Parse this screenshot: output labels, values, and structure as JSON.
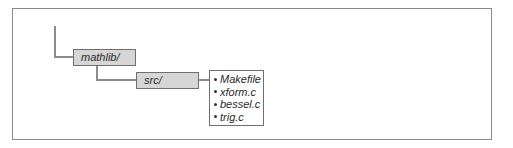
{
  "diagram": {
    "type": "directory-tree",
    "nodes": [
      {
        "id": "mathlib",
        "label": "mathlib/",
        "kind": "directory",
        "parent": null
      },
      {
        "id": "src",
        "label": "src/",
        "kind": "directory",
        "parent": "mathlib"
      }
    ],
    "files": {
      "parent": "src",
      "items": [
        {
          "label": "Makefile"
        },
        {
          "label": "xform.c"
        },
        {
          "label": "bessel.c"
        },
        {
          "label": "trig.c"
        }
      ]
    },
    "colors": {
      "node_fill": "#d6d6d6",
      "node_border": "#6f6f6f",
      "connector": "#8c8c8c",
      "frame_border": "#8a8a8a",
      "text": "#2a2a2a"
    }
  }
}
